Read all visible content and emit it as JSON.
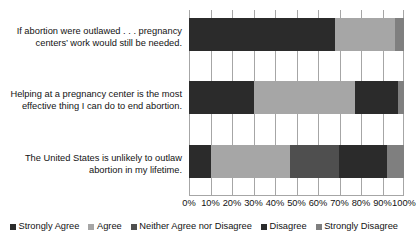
{
  "chart_data": {
    "type": "bar",
    "subtype": "stacked-horizontal-100",
    "title": "",
    "xlabel": "",
    "ylabel": "",
    "xlim": [
      0,
      100
    ],
    "grid": true,
    "legend_position": "bottom",
    "categories": [
      "If abortion were outlawed . . . pregnancy centers’ work would still be needed.",
      "Helping at a pregnancy center is the most effective thing I can do to end abortion.",
      "The United States is unlikely to outlaw abortion in my lifetime."
    ],
    "xticks": [
      "0%",
      "10%",
      "20%",
      "30%",
      "40%",
      "50%",
      "60%",
      "70%",
      "80%",
      "90%",
      "100%"
    ],
    "xtick_values": [
      0,
      10,
      20,
      30,
      40,
      50,
      60,
      70,
      80,
      90,
      100
    ],
    "series": [
      {
        "name": "Strongly Agree",
        "color": "#2b2b2b",
        "values": [
          68,
          30,
          10
        ]
      },
      {
        "name": "Agree",
        "color": "#a6a6a6",
        "values": [
          28,
          47,
          37
        ]
      },
      {
        "name": "Neither Agree nor Disagree",
        "color": "#4f4f4f",
        "values": [
          0,
          0,
          23
        ]
      },
      {
        "name": "Disagree",
        "color": "#2b2b2b",
        "values": [
          0,
          20,
          22
        ]
      },
      {
        "name": "Strongly Disagree",
        "color": "#7f7f7f",
        "values": [
          4,
          3,
          8
        ]
      }
    ]
  },
  "legend": {
    "items": [
      {
        "label": "Strongly Agree",
        "color": "#2b2b2b"
      },
      {
        "label": "Agree",
        "color": "#a6a6a6"
      },
      {
        "label": "Neither Agree nor Disagree",
        "color": "#4f4f4f"
      },
      {
        "label": "Disagree",
        "color": "#2b2b2b"
      },
      {
        "label": "Strongly Disagree",
        "color": "#7f7f7f"
      }
    ]
  }
}
